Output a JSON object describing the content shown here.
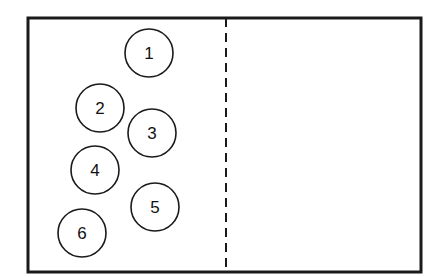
{
  "diagram": {
    "frame": {
      "x": 28,
      "y": 18,
      "width": 393,
      "height": 254,
      "stroke": "#1a1a1a"
    },
    "divider": {
      "x": 226,
      "style": "dashed"
    },
    "circles": [
      {
        "label": "1",
        "cx": 149,
        "cy": 53,
        "r": 24
      },
      {
        "label": "2",
        "cx": 100,
        "cy": 108,
        "r": 24
      },
      {
        "label": "3",
        "cx": 152,
        "cy": 133,
        "r": 24
      },
      {
        "label": "4",
        "cx": 95,
        "cy": 170,
        "r": 24
      },
      {
        "label": "5",
        "cx": 155,
        "cy": 207,
        "r": 24
      },
      {
        "label": "6",
        "cx": 82,
        "cy": 233,
        "r": 24
      }
    ]
  }
}
